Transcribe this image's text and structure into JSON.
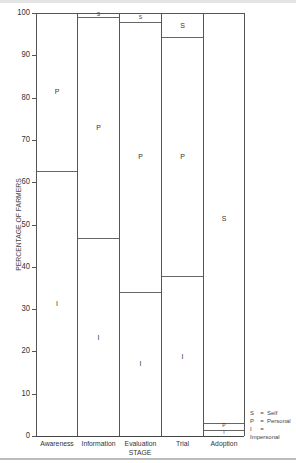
{
  "chart_data": {
    "type": "bar",
    "stacked": true,
    "title": "",
    "xlabel": "STAGE",
    "ylabel": "PERCENTAGE OF FARMERS",
    "ylim": [
      0,
      100
    ],
    "yticks": [
      0,
      10,
      20,
      30,
      40,
      50,
      60,
      70,
      80,
      90,
      100
    ],
    "grid": false,
    "legend_position": "bottom-right",
    "categories": [
      "Awareness",
      "Information",
      "Evaluation",
      "Trial",
      "Adoption"
    ],
    "series": [
      {
        "name": "Impersonal",
        "key": "I",
        "values": [
          63,
          47,
          34.3,
          38,
          1.7
        ]
      },
      {
        "name": "Personal",
        "key": "P",
        "values": [
          37,
          52.3,
          63.7,
          56.5,
          1.6
        ]
      },
      {
        "name": "Self",
        "key": "S",
        "values": [
          0,
          0.7,
          2,
          5.5,
          96.7
        ]
      }
    ],
    "legend": [
      {
        "key": "S",
        "label": "Self"
      },
      {
        "key": "P",
        "label": "Personal"
      },
      {
        "key": "I",
        "label": "Impersonal"
      }
    ]
  },
  "axis": {
    "ylabel": "PERCENTAGE OF FARMERS",
    "xtitle": "STAGE",
    "yticks": [
      "0",
      "10",
      "20",
      "30",
      "40",
      "50",
      "60",
      "70",
      "80",
      "90",
      "100"
    ],
    "categories": [
      "Awareness",
      "Information",
      "Evaluation",
      "Trial",
      "Adoption"
    ]
  },
  "legend": {
    "eq": "=",
    "items": [
      {
        "key": "S",
        "label": "Self"
      },
      {
        "key": "P",
        "label": "Personal"
      },
      {
        "key": "I",
        "label": "Impersonal"
      }
    ]
  },
  "segment_labels": {
    "I": "I",
    "P": "P",
    "S": "S"
  }
}
